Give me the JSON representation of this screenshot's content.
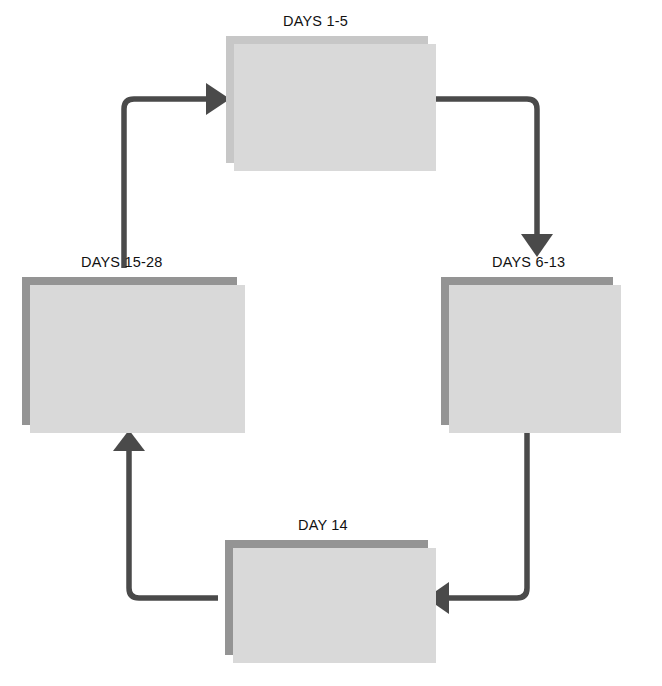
{
  "diagram": {
    "type": "cycle-flow-diagram",
    "colors": {
      "background": "#ffffff",
      "box_light": "#c7c7c7",
      "box_dark": "#949494",
      "box_shadow": "#d9d9d9",
      "arrow": "#4a4a4a",
      "text": "#000000"
    },
    "nodes": [
      {
        "id": "menses",
        "day_label": "DAYS 1-5",
        "title": "Menses (menstrual) period",
        "body": "Small patches of dead cells of uterine lining slough off, leaving torn blood vessels; menstrual bleeding comes from these torn vessels",
        "shade": "light"
      },
      {
        "id": "proliferative",
        "day_label": "DAYS 6-13",
        "title": "Proliferative phase",
        "body": "Epithelial cells reproduce, repairing uterine lining",
        "shade": "dark"
      },
      {
        "id": "ovulation",
        "day_label": "DAY 14",
        "title": "Ovulation",
        "body": "Ovum is released from ovary and moves into uterine (fallopian) tube for possible fertilization",
        "shade": "dark"
      },
      {
        "id": "secretory",
        "day_label": "DAYS 15-28",
        "title": "Secretory phase",
        "body": "Uterine lining prepares for pregnancy (that is, implantation of fertilized ovum) by growing thicker, secreting, and developing greater blood supply; on last day, blood supply decreases greatly, causing some lining cells to die",
        "shade": "dark"
      }
    ],
    "arrows": [
      {
        "id": "secretory-to-menses",
        "from": "secretory",
        "to": "menses",
        "direction": "right"
      },
      {
        "id": "menses-to-proliferative",
        "from": "menses",
        "to": "proliferative",
        "direction": "down"
      },
      {
        "id": "proliferative-to-ovulation",
        "from": "proliferative",
        "to": "ovulation",
        "direction": "left"
      },
      {
        "id": "ovulation-to-secretory",
        "from": "ovulation",
        "to": "secretory",
        "direction": "up"
      }
    ]
  }
}
